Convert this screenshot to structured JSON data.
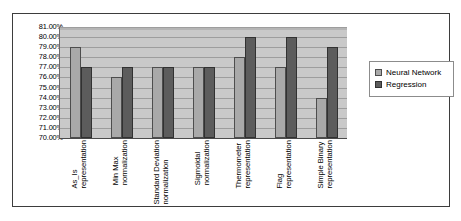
{
  "chart_data": {
    "type": "bar",
    "title": "",
    "xlabel": "",
    "ylabel": "",
    "ylim": [
      70,
      81
    ],
    "ytick_format": "percent",
    "grid": true,
    "legend_position": "right",
    "categories": [
      "As_Is representation",
      "Min Max normalization",
      "Standard Deviation normalization",
      "Sigmoidal normalization",
      "Thermometer representation",
      "Flag representation",
      "Simple Binary representation"
    ],
    "category_lines": [
      [
        "As_Is",
        "representation"
      ],
      [
        "Min Max",
        "normalization"
      ],
      [
        "Standard Deviation",
        "normalization"
      ],
      [
        "Sigmoidal",
        "normalization"
      ],
      [
        "Thermometer",
        "representation"
      ],
      [
        "Flag",
        "representation"
      ],
      [
        "Simple Binary",
        "representation"
      ]
    ],
    "yticks": [
      "70.00%",
      "71.00%",
      "72.00%",
      "73.00%",
      "74.00%",
      "75.00%",
      "76.00%",
      "77.00%",
      "78.00%",
      "79.00%",
      "80.00%",
      "81.00%"
    ],
    "ytick_values": [
      70,
      71,
      72,
      73,
      74,
      75,
      76,
      77,
      78,
      79,
      80,
      81
    ],
    "series": [
      {
        "name": "Neural Network",
        "color": "#a9a9a9",
        "values": [
          79,
          76,
          77,
          77,
          78,
          77,
          74
        ]
      },
      {
        "name": "Regression",
        "color": "#5c5c5c",
        "values": [
          77,
          77,
          77,
          77,
          80,
          80,
          79
        ]
      }
    ]
  },
  "legend": {
    "entries": [
      {
        "label": "Neural Network"
      },
      {
        "label": "Regression"
      }
    ]
  }
}
